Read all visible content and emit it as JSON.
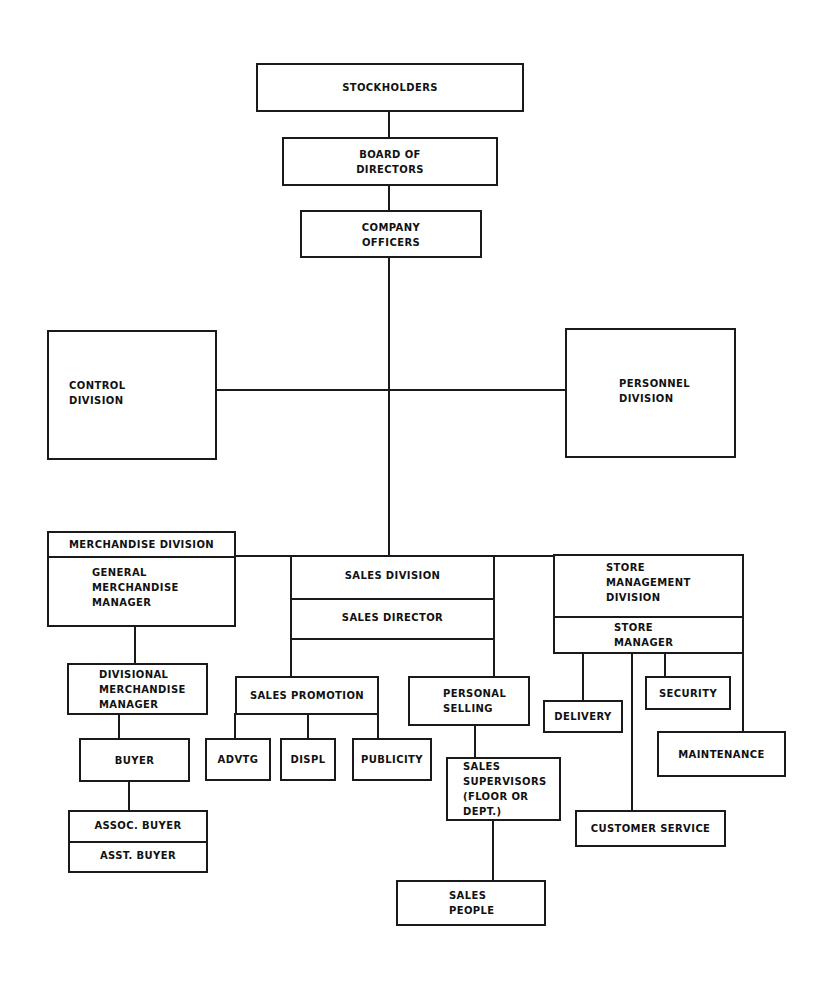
{
  "chart": {
    "type": "organization-chart",
    "nodes": {
      "stockholders": "STOCKHOLDERS",
      "board": "BOARD OF\nDIRECTORS",
      "officers": "COMPANY\nOFFICERS",
      "control": "CONTROL\nDIVISION",
      "personnel": "PERSONNEL\nDIVISION",
      "merch_division": "MERCHANDISE DIVISION",
      "gmm": "GENERAL\nMERCHANDISE\nMANAGER",
      "dmm": "DIVISIONAL\nMERCHANDISE\nMANAGER",
      "buyer": "BUYER",
      "assoc_buyer": "ASSOC. BUYER",
      "asst_buyer": "ASST. BUYER",
      "sales_division": "SALES DIVISION",
      "sales_director": "SALES DIRECTOR",
      "sales_promotion": "SALES PROMOTION",
      "advtg": "ADVTG",
      "displ": "DISPL",
      "publicity": "PUBLICITY",
      "personal_selling": "PERSONAL\nSELLING",
      "sales_supervisors": "SALES\nSUPERVISORS\n(FLOOR OR\nDEPT.)",
      "sales_people": "SALES\nPEOPLE",
      "store_division": "STORE\nMANAGEMENT\nDIVISION",
      "store_manager": "STORE\nMANAGER",
      "delivery": "DELIVERY",
      "security": "SECURITY",
      "maintenance": "MAINTENANCE",
      "customer_service": "CUSTOMER SERVICE"
    },
    "edges": [
      [
        "stockholders",
        "board"
      ],
      [
        "board",
        "officers"
      ],
      [
        "officers",
        "control"
      ],
      [
        "officers",
        "personnel"
      ],
      [
        "officers",
        "merch_division"
      ],
      [
        "officers",
        "sales_division"
      ],
      [
        "officers",
        "store_division"
      ],
      [
        "gmm",
        "dmm"
      ],
      [
        "dmm",
        "buyer"
      ],
      [
        "buyer",
        "assoc_buyer"
      ],
      [
        "sales_director",
        "sales_promotion"
      ],
      [
        "sales_director",
        "personal_selling"
      ],
      [
        "sales_promotion",
        "advtg"
      ],
      [
        "sales_promotion",
        "displ"
      ],
      [
        "sales_promotion",
        "publicity"
      ],
      [
        "personal_selling",
        "sales_supervisors"
      ],
      [
        "sales_supervisors",
        "sales_people"
      ],
      [
        "store_manager",
        "delivery"
      ],
      [
        "store_manager",
        "customer_service"
      ],
      [
        "store_manager",
        "security"
      ],
      [
        "store_manager",
        "maintenance"
      ]
    ]
  }
}
